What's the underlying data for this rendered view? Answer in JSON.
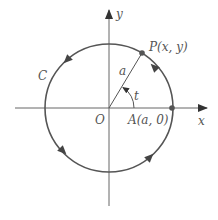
{
  "diagram": {
    "type": "circle-parametrization",
    "labels": {
      "y_axis": "y",
      "x_axis": "x",
      "origin": "O",
      "point_P": "P(x, y)",
      "point_A": "A(a, 0)",
      "radius": "a",
      "angle": "t",
      "curve": "C"
    },
    "geometry": {
      "center": [
        109,
        108
      ],
      "radius": 64,
      "angle_deg": 59,
      "orientation": "counterclockwise"
    },
    "colors": {
      "axis": "#666666",
      "circle": "#555555",
      "arrow": "#444444",
      "point": "#555555",
      "text": "#555555"
    }
  }
}
